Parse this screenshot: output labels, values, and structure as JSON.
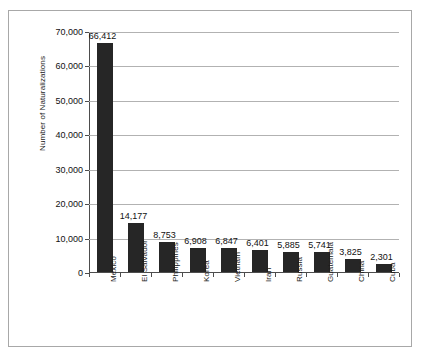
{
  "chart_data": {
    "type": "bar",
    "title": "",
    "xlabel": "",
    "ylabel": "Number of Naturalizations",
    "ylim": [
      0,
      70000
    ],
    "ytick_labels": [
      "70,000",
      "60,000",
      "50,000",
      "40,000",
      "30,000",
      "20,000",
      "10,000",
      "0"
    ],
    "ytick_values": [
      70000,
      60000,
      50000,
      40000,
      30000,
      20000,
      10000,
      0
    ],
    "grid": true,
    "legend": "none",
    "categories": [
      "Mexico",
      "El Salvador",
      "Philippines",
      "Korea",
      "Vietnam",
      "Iran",
      "Russia",
      "Guatemala",
      "China",
      "Cuba"
    ],
    "values": [
      66412,
      14177,
      8753,
      6908,
      6847,
      6401,
      5885,
      5741,
      3825,
      2301
    ],
    "value_labels": [
      "66,412",
      "14,177",
      "8,753",
      "6,908",
      "6,847",
      "6,401",
      "5,885",
      "5,741",
      "3,825",
      "2,301"
    ],
    "bar_color": "#262626",
    "gridline_color": "#b2b2b2",
    "axis_color": "#4d4d4d",
    "frame_color": "#a8a8a8",
    "background_color": "#ffffff"
  }
}
